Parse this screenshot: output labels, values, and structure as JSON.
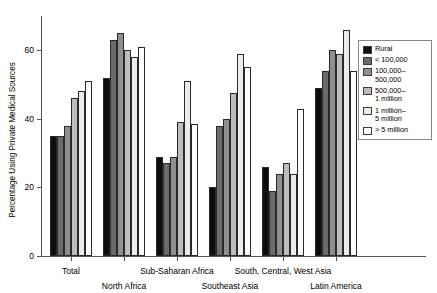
{
  "chart_data": {
    "type": "bar",
    "title": "",
    "subtitle": "",
    "xlabel": "",
    "ylabel": "Percentage Using Private Medical Sources",
    "ylim": [
      0,
      70
    ],
    "yticks": [
      0,
      20,
      40,
      60
    ],
    "ytick_labels": [
      "0",
      "20",
      "40",
      "60"
    ],
    "grid": false,
    "legend_position": "right",
    "categories": [
      "Total",
      "North Africa",
      "Sub-Saharan Africa",
      "Southeast Asia",
      "South, Central, West Asia",
      "Latin America"
    ],
    "category_label_rows": [
      0,
      1,
      0,
      1,
      0,
      1
    ],
    "series": [
      {
        "name": "Rural",
        "color": "#0d0d0d",
        "values": [
          35,
          52,
          29,
          20,
          26,
          49
        ]
      },
      {
        "name": "< 100,000",
        "color": "#6b6b6b",
        "values": [
          35,
          63,
          27,
          38,
          19,
          54
        ]
      },
      {
        "name": "100,000–\n500,000",
        "color": "#8f8f8f",
        "values": [
          38,
          65,
          29,
          40,
          24,
          60
        ]
      },
      {
        "name": "500,000–\n1 million",
        "color": "#bdbdbd",
        "values": [
          46,
          60,
          39,
          47.5,
          27,
          59
        ]
      },
      {
        "name": "1 million–\n5 million",
        "color": "#ececec",
        "values": [
          48,
          58,
          51,
          59,
          24,
          66
        ]
      },
      {
        "name": "> 5 million",
        "color": "#ffffff",
        "values": [
          51,
          61,
          38.5,
          55,
          43,
          54
        ]
      }
    ]
  },
  "legend": {
    "entries": [
      {
        "label": "Rural",
        "swatch": "#0d0d0d"
      },
      {
        "label": "< 100,000",
        "swatch": "#6b6b6b"
      },
      {
        "label": "100,000–\n500,000",
        "swatch": "#8f8f8f"
      },
      {
        "label": "500,000–\n1 million",
        "swatch": "#bdbdbd"
      },
      {
        "label": "1 million–\n5 million",
        "swatch": "#ececec"
      },
      {
        "label": "> 5 million",
        "swatch": "#ffffff"
      }
    ]
  }
}
